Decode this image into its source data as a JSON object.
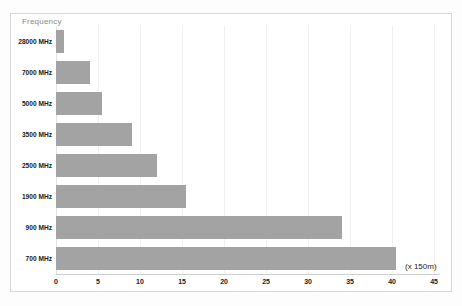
{
  "chart": {
    "axis_title": "Frequency",
    "x_unit_label": "(x 150m)"
  },
  "chart_data": {
    "type": "bar",
    "orientation": "horizontal",
    "title": "",
    "subtitle": "",
    "xlabel": "(x 150m)",
    "ylabel": "Frequency",
    "categories": [
      "28000 MHz",
      "7000 MHz",
      "5000 MHz",
      "3500 MHz",
      "2500 MHz",
      "1900 MHz",
      "900 MHz",
      "700 MHz"
    ],
    "values": [
      1,
      4,
      5.5,
      9,
      12,
      15.5,
      34,
      40.5
    ],
    "xlim": [
      0,
      45.7
    ],
    "xticks": [
      0,
      5,
      10,
      15,
      20,
      25,
      30,
      35,
      40,
      45
    ],
    "xtick_labels": [
      "0",
      "5",
      "10",
      "15",
      "20",
      "25",
      "30",
      "35",
      "40",
      "45"
    ],
    "grid": true,
    "grid_axis": "x",
    "legend": false,
    "bar_color": "#a3a3a3",
    "background_color": "#ffffff",
    "frame_color": "#d8d8d8"
  }
}
